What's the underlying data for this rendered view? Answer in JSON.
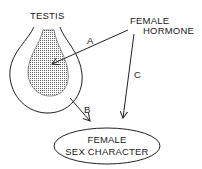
{
  "diagram": {
    "nodes": {
      "testis": {
        "label": "TESTIS"
      },
      "female_hormone": {
        "line1": "FEMALE",
        "line2": "HORMONE"
      },
      "female_sex_character": {
        "line1": "FEMALE",
        "line2": "SEX CHARACTER"
      }
    },
    "edges": {
      "a": {
        "label": "A",
        "from": "FEMALE HORMONE",
        "to": "TESTIS (inner region)"
      },
      "b": {
        "label": "B",
        "from": "TESTIS",
        "to": "FEMALE SEX CHARACTER"
      },
      "c": {
        "label": "C",
        "from": "FEMALE HORMONE",
        "to": "FEMALE SEX CHARACTER"
      }
    },
    "colors": {
      "line": "#222222",
      "background": "#ffffff",
      "stipple": "#555555"
    }
  }
}
